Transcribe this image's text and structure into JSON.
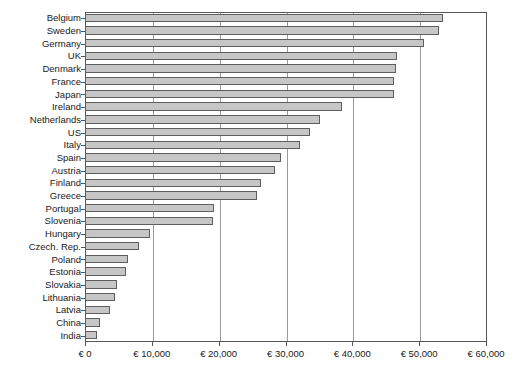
{
  "chart_data": {
    "type": "bar",
    "orientation": "horizontal",
    "title": "",
    "subtitle": "",
    "xlabel": "",
    "ylabel": "",
    "xlim": [
      0,
      60000
    ],
    "ylim": null,
    "grid": true,
    "legend": null,
    "currency_symbol": "€",
    "xticks": [
      0,
      10000,
      20000,
      30000,
      40000,
      50000,
      60000
    ],
    "xtick_labels": [
      "€ 0",
      "€ 10,000",
      "€ 20,000",
      "€ 30,000",
      "€ 40,000",
      "€ 50,000",
      "€ 60,000"
    ],
    "categories": [
      "Belgium",
      "Sweden",
      "Germany",
      "UK",
      "Denmark",
      "France",
      "Japan",
      "Ireland",
      "Netherlands",
      "US",
      "Italy",
      "Spain",
      "Austria",
      "Finland",
      "Greece",
      "Portugal",
      "Slovenia",
      "Hungary",
      "Czech. Rep.",
      "Poland",
      "Estonia",
      "Slovakia",
      "Lithuania",
      "Latvia",
      "China",
      "India"
    ],
    "values": [
      53500,
      53000,
      50700,
      46700,
      46500,
      46300,
      46200,
      38500,
      35200,
      33600,
      32100,
      29300,
      28400,
      26300,
      25800,
      19300,
      19100,
      9700,
      8100,
      6400,
      6100,
      4800,
      4500,
      3700,
      2200,
      1800
    ],
    "bar_fill_color": "#c6c6c6",
    "bar_edge_color": "#5e5e5e",
    "gridline_color": "#9a9a9a",
    "axis_color": "#555555",
    "background_color": "#ffffff"
  }
}
